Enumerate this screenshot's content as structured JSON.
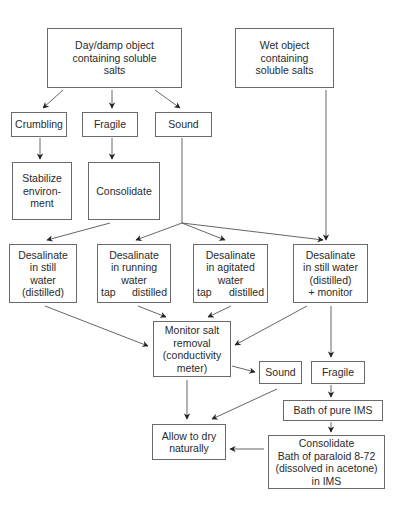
{
  "diagram": {
    "type": "flowchart",
    "nodes": {
      "dry_damp_object": {
        "lines": [
          "Day/damp object",
          "containing soluble",
          "salts"
        ]
      },
      "wet_object": {
        "lines": [
          "Wet object",
          "containing",
          "soluble salts"
        ]
      },
      "crumbling": {
        "lines": [
          "Crumbling"
        ]
      },
      "fragile_top": {
        "lines": [
          "Fragile"
        ]
      },
      "sound_top": {
        "lines": [
          "Sound"
        ]
      },
      "stabilize": {
        "lines": [
          "Stabilize",
          "environ-",
          "ment"
        ]
      },
      "consolidate_top": {
        "lines": [
          "Consolidate"
        ]
      },
      "desalinate_still": {
        "lines": [
          "Desalinate",
          "in still",
          "water",
          "(distilled)"
        ]
      },
      "desalinate_running": {
        "lines": [
          "Desalinate",
          "in running",
          "water"
        ],
        "split": [
          "tap",
          "distilled"
        ]
      },
      "desalinate_agitated": {
        "lines": [
          "Desalinate",
          "in agitated",
          "water"
        ],
        "split": [
          "tap",
          "distilled"
        ]
      },
      "desalinate_still_monitor": {
        "lines": [
          "Desalinate",
          "in still water",
          "(distilled)",
          "+ monitor"
        ]
      },
      "monitor_salt": {
        "lines": [
          "Monitor salt",
          "removal",
          "(conductivity",
          "meter)"
        ]
      },
      "sound_bottom": {
        "lines": [
          "Sound"
        ]
      },
      "fragile_bottom": {
        "lines": [
          "Fragile"
        ]
      },
      "bath_pure_ims": {
        "lines": [
          "Bath of pure IMS"
        ]
      },
      "allow_dry": {
        "lines": [
          "Allow to dry",
          "naturally"
        ]
      },
      "consolidate_bottom": {
        "lines": [
          "Consolidate",
          "Bath of paraloid 8-72",
          "(dissolved in acetone)",
          "in IMS"
        ]
      }
    },
    "edges": [
      [
        "dry_damp_object",
        "crumbling"
      ],
      [
        "dry_damp_object",
        "fragile_top"
      ],
      [
        "dry_damp_object",
        "sound_top"
      ],
      [
        "crumbling",
        "stabilize"
      ],
      [
        "fragile_top",
        "consolidate_top"
      ],
      [
        "consolidate_top",
        "desalinate_still"
      ],
      [
        "sound_top",
        "desalinate_running"
      ],
      [
        "sound_top",
        "desalinate_agitated"
      ],
      [
        "sound_top",
        "desalinate_still_monitor"
      ],
      [
        "wet_object",
        "desalinate_still_monitor"
      ],
      [
        "desalinate_still",
        "monitor_salt"
      ],
      [
        "desalinate_running",
        "monitor_salt"
      ],
      [
        "desalinate_agitated",
        "monitor_salt"
      ],
      [
        "desalinate_still_monitor",
        "monitor_salt"
      ],
      [
        "desalinate_still_monitor",
        "fragile_bottom"
      ],
      [
        "monitor_salt",
        "sound_bottom"
      ],
      [
        "monitor_salt",
        "allow_dry"
      ],
      [
        "sound_bottom",
        "allow_dry"
      ],
      [
        "fragile_bottom",
        "bath_pure_ims"
      ],
      [
        "bath_pure_ims",
        "consolidate_bottom"
      ],
      [
        "consolidate_bottom",
        "allow_dry"
      ]
    ]
  }
}
